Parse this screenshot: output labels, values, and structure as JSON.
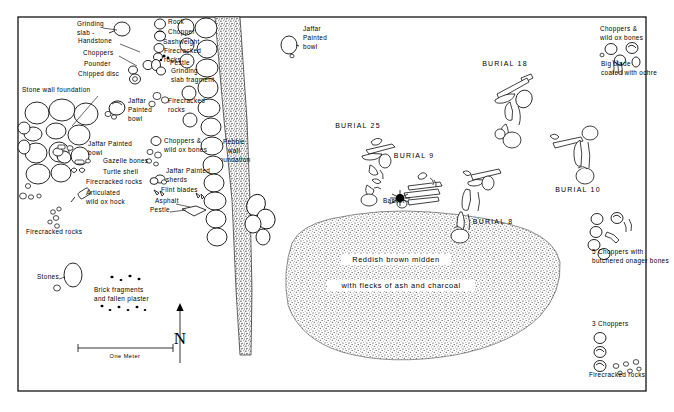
{
  "figure": {
    "type": "archaeological-site-plan",
    "background_color": "#ffffff",
    "ink_color": "#000000",
    "frame": {
      "x": 18,
      "y": 17,
      "width": 628,
      "height": 374
    }
  },
  "scale_bar": {
    "label": "One Meter",
    "x": 78,
    "y": 352,
    "length_px": 95
  },
  "north_arrow": {
    "label": "N"
  },
  "midden": {
    "line1": "Reddish brown midden",
    "line2": "with flecks of ash and charcoal",
    "fill_description": "stippled"
  },
  "wall_labels": {
    "stone_wall_foundation": "Stone wall foundation",
    "pebble_wall_foundation": [
      "Pebble",
      "wall",
      "foundation"
    ]
  },
  "burials": [
    {
      "name": "BURIAL 25",
      "x": 358,
      "y": 128
    },
    {
      "name": "BURIAL 9",
      "x": 414,
      "y": 158
    },
    {
      "name": "BURIAL 8",
      "x": 493,
      "y": 224
    },
    {
      "name": "BURIAL 18",
      "x": 505,
      "y": 66
    },
    {
      "name": "BURIAL 10",
      "x": 578,
      "y": 192
    }
  ],
  "find_labels": [
    {
      "id": "grinding-slab",
      "lines": [
        "Grinding",
        "slab -"
      ],
      "x": 77,
      "y": 26,
      "anchor": "start"
    },
    {
      "id": "handstone",
      "lines": [
        "Handstone"
      ],
      "x": 78,
      "y": 43,
      "anchor": "start"
    },
    {
      "id": "choppers-left",
      "lines": [
        "Choppers"
      ],
      "x": 83,
      "y": 55,
      "anchor": "start"
    },
    {
      "id": "pounder",
      "lines": [
        "Pounder"
      ],
      "x": 84,
      "y": 66,
      "anchor": "start"
    },
    {
      "id": "chipped-disc",
      "lines": [
        "Chipped disc"
      ],
      "x": 78,
      "y": 76,
      "anchor": "start"
    },
    {
      "id": "rock",
      "lines": [
        "Rock"
      ],
      "x": 168,
      "y": 24,
      "anchor": "start"
    },
    {
      "id": "chopper",
      "lines": [
        "Chopper"
      ],
      "x": 168,
      "y": 34,
      "anchor": "start"
    },
    {
      "id": "sashweight",
      "lines": [
        "Sashweight"
      ],
      "x": 163,
      "y": 44,
      "anchor": "start"
    },
    {
      "id": "firecracked-rocks-top",
      "lines": [
        "Firecracked",
        "rocks"
      ],
      "x": 164,
      "y": 53,
      "anchor": "start"
    },
    {
      "id": "pestle-top",
      "lines": [
        "Pestle"
      ],
      "x": 170,
      "y": 65,
      "anchor": "start"
    },
    {
      "id": "grinding-slab-fragment",
      "lines": [
        "Grinding",
        "slab fragment"
      ],
      "x": 171,
      "y": 73,
      "anchor": "start"
    },
    {
      "id": "stone-wall-foundation",
      "lines": [
        "Stone wall foundation"
      ],
      "x": 22,
      "y": 92,
      "anchor": "start"
    },
    {
      "id": "jaffar-painted-bowl-upper",
      "lines": [
        "Jaffar",
        "Painted",
        "bowl"
      ],
      "x": 128,
      "y": 103,
      "anchor": "start"
    },
    {
      "id": "firecracked-rocks-upper",
      "lines": [
        "Firecracked",
        "rocks"
      ],
      "x": 168,
      "y": 103,
      "anchor": "start"
    },
    {
      "id": "jaffar-painted-bowl-mid",
      "lines": [
        "Jaffar Painted",
        "bowl"
      ],
      "x": 88,
      "y": 146,
      "anchor": "start"
    },
    {
      "id": "gazelle-bones",
      "lines": [
        "Gazelle bones"
      ],
      "x": 103,
      "y": 163,
      "anchor": "start"
    },
    {
      "id": "turtle-shell",
      "lines": [
        "Turtle shell"
      ],
      "x": 103,
      "y": 174,
      "anchor": "start"
    },
    {
      "id": "firecracked-rocks-mid",
      "lines": [
        "Firecracked rocks"
      ],
      "x": 86,
      "y": 184,
      "anchor": "start"
    },
    {
      "id": "articulated-wild-ox-hock",
      "lines": [
        "Articulated",
        "wild ox hock"
      ],
      "x": 86,
      "y": 195,
      "anchor": "start"
    },
    {
      "id": "firecracked-rocks-lower",
      "lines": [
        "Firecracked rocks"
      ],
      "x": 26,
      "y": 234,
      "anchor": "start"
    },
    {
      "id": "choppers-wild-ox-bones-mid",
      "lines": [
        "Choppers &",
        "wild ox bones"
      ],
      "x": 164,
      "y": 143,
      "anchor": "start"
    },
    {
      "id": "jaffar-painted-sherds",
      "lines": [
        "Jaffar Painted",
        "sherds"
      ],
      "x": 166,
      "y": 173,
      "anchor": "start"
    },
    {
      "id": "flint-blades",
      "lines": [
        "Flint blades"
      ],
      "x": 161,
      "y": 192,
      "anchor": "start"
    },
    {
      "id": "asphalt",
      "lines": [
        "Asphalt"
      ],
      "x": 155,
      "y": 203,
      "anchor": "start"
    },
    {
      "id": "pestle-lower",
      "lines": [
        "Pestle"
      ],
      "x": 150,
      "y": 212,
      "anchor": "start"
    },
    {
      "id": "stones",
      "lines": [
        "Stones"
      ],
      "x": 37,
      "y": 279,
      "anchor": "start"
    },
    {
      "id": "brick-fragments",
      "lines": [
        "Brick fragments",
        "and fallen plaster"
      ],
      "x": 94,
      "y": 292,
      "anchor": "start"
    },
    {
      "id": "jaffar-painted-bowl-top-right",
      "lines": [
        "Jaffar",
        "Painted",
        "bowl"
      ],
      "x": 303,
      "y": 31,
      "anchor": "start"
    },
    {
      "id": "choppers-wild-ox-bones-right",
      "lines": [
        "Choppers &",
        "wild ox bones"
      ],
      "x": 600,
      "y": 31,
      "anchor": "start"
    },
    {
      "id": "big-blade-ochre",
      "lines": [
        "Big blade",
        "coated with ochre"
      ],
      "x": 601,
      "y": 66,
      "anchor": "start"
    },
    {
      "id": "basket",
      "lines": [
        "Basket"
      ],
      "x": 383,
      "y": 203,
      "anchor": "start"
    },
    {
      "id": "choppers-onager",
      "lines": [
        "5 Choppers with",
        "butchered onager bones"
      ],
      "x": 592,
      "y": 254,
      "anchor": "start"
    },
    {
      "id": "three-choppers",
      "lines": [
        "3 Choppers"
      ],
      "x": 592,
      "y": 326,
      "anchor": "start"
    },
    {
      "id": "firecracked-rocks-br",
      "lines": [
        "Firecracked rocks"
      ],
      "x": 589,
      "y": 377,
      "anchor": "start"
    }
  ]
}
